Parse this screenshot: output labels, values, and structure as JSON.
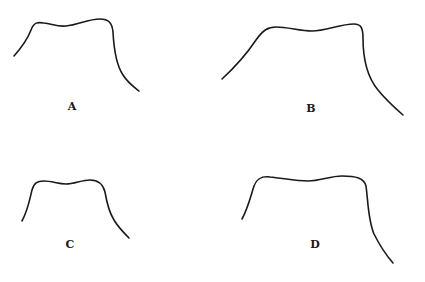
{
  "figure": {
    "background": "#ffffff",
    "stroke_color": "#1a1a1a",
    "panels": [
      {
        "id": "A",
        "label": "A",
        "label_pos": [
          72,
          106
        ],
        "shape": "asymmetric plateau profile with gentle dip at crest, left flank short, right flank steep then flaring",
        "path": "M14,56 C22,47 28,38 31,30 C34,22 38,22 44,23 C52,24 58,27 66,26 C78,25 88,19 100,19 C108,19 112,22 113,32 C114,52 117,66 123,75 C128,83 134,87 139,91"
      },
      {
        "id": "B",
        "label": "B",
        "label_pos": [
          311,
          108
        ],
        "shape": "wide plateau profile, long gradual left flank, steep right shoulder with long tail",
        "path": "M222,79 C234,68 246,55 256,40 C263,30 268,27 276,27 C288,27 300,31 312,31 C326,31 340,24 354,24 C361,24 363,28 363,38 C363,62 368,78 378,90 C386,100 395,108 403,115"
      },
      {
        "id": "C",
        "label": "C",
        "label_pos": [
          70,
          244
        ],
        "shape": "narrow plateau profile, symmetric-ish shoulders, short flanks",
        "path": "M22,221 C28,210 30,198 32,190 C34,183 37,181 44,181 C52,181 58,184 66,184 C74,184 82,180 90,180 C98,180 103,184 105,192 C107,204 109,212 114,220 C118,227 124,233 129,238"
      },
      {
        "id": "D",
        "label": "D",
        "label_pos": [
          315,
          244
        ],
        "shape": "wide flat plateau profile, short left flank, very steep right shoulder with long tail",
        "path": "M242,219 C248,208 251,195 254,186 C257,178 262,176 270,177 C282,178 296,181 308,181 C320,181 330,176 342,176 C356,176 364,178 366,186 C368,200 368,220 374,234 C380,246 386,255 393,263"
      }
    ]
  }
}
